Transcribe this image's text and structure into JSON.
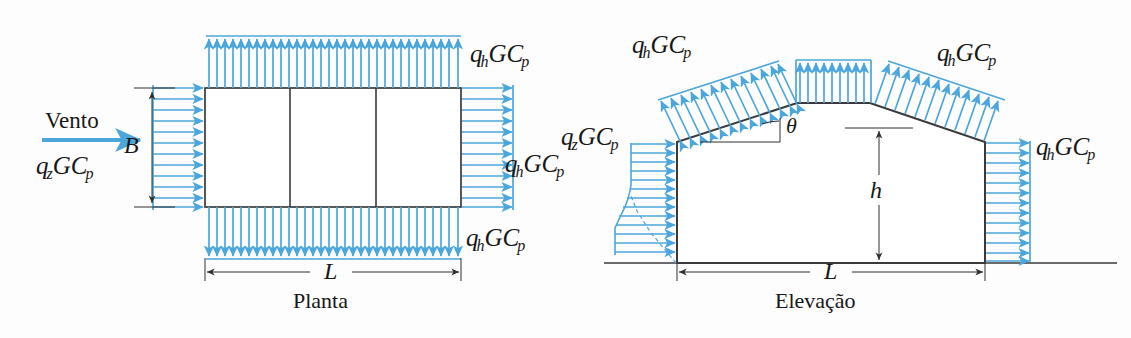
{
  "figure": {
    "domain": "engineering-wind-load-diagram",
    "background_color": "#fdfdfd",
    "arrow_color": "#4ba6dc",
    "outline_color": "#3a3a3a",
    "text_color": "#171717"
  },
  "plan": {
    "caption": "Planta",
    "wind_label": "Vento",
    "wind_pressure": {
      "q": "q",
      "qsub": "z",
      "G": "GC",
      "psub": "p"
    },
    "width_label": "B",
    "length_label": "L",
    "pressure_top": {
      "q": "q",
      "qsub": "h",
      "G": "GC",
      "psub": "p"
    },
    "pressure_right": {
      "q": "q",
      "qsub": "h",
      "G": "GC",
      "psub": "p"
    },
    "pressure_bottom": {
      "q": "q",
      "qsub": "h",
      "G": "GC",
      "psub": "p"
    },
    "bays": 3
  },
  "elevation": {
    "caption": "Elevação",
    "height_label": "h",
    "length_label": "L",
    "angle_label": "θ",
    "pressure_windward_wall": {
      "q": "q",
      "qsub": "z",
      "G": "GC",
      "psub": "p"
    },
    "pressure_left_roof": {
      "q": "q",
      "qsub": "h",
      "G": "GC",
      "psub": "p"
    },
    "pressure_right_roof": {
      "q": "q",
      "qsub": "h",
      "G": "GC",
      "psub": "p"
    },
    "pressure_leeward_wall": {
      "q": "q",
      "qsub": "h",
      "G": "GC",
      "psub": "p"
    }
  }
}
